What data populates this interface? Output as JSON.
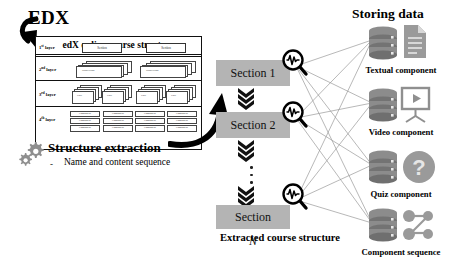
{
  "heading": {
    "brand": "EDX"
  },
  "panel": {
    "title": "edX online course structure",
    "layers": [
      {
        "label_num": "1",
        "label_sup": "st",
        "label_rest": " layer",
        "items": [
          "Section",
          "Section"
        ]
      },
      {
        "label_num": "2",
        "label_sup": "nd",
        "label_rest": " layer",
        "items": [
          "Subsection",
          "Subsection"
        ]
      },
      {
        "label_num": "3",
        "label_sup": "rd",
        "label_rest": " layer",
        "items": [
          "Unit",
          "Unit",
          "Unit",
          "Unit"
        ]
      },
      {
        "label_num": "4",
        "label_sup": "th",
        "label_rest": " layer",
        "items": [
          "Component",
          "Component",
          "Component",
          "Component"
        ]
      }
    ]
  },
  "structure_extraction": {
    "title": "Structure extraction",
    "bullet_dash": "-",
    "bullet_text": "Name and content sequence",
    "icon": "gears-icon"
  },
  "middle": {
    "sections": [
      {
        "name": "section-1",
        "label": "Section 1",
        "italic_suffix": ""
      },
      {
        "name": "section-2",
        "label": "Section 2",
        "italic_suffix": ""
      },
      {
        "name": "section-n",
        "label": "Section ",
        "italic_suffix": "N"
      }
    ],
    "caption": "Extracted course structure",
    "magnifier_icon": "magnifier-waveform-icon",
    "chevron_icon": "triple-chevron-down-icon",
    "ellipsis_icon": "vertical-dots-icon",
    "arrow_icon": "curved-arrow-icon"
  },
  "storing": {
    "title": "Storing data",
    "items": [
      {
        "key": "textual",
        "label": "Textual component",
        "db_icon": "database-icon",
        "type_icon": "document-icon"
      },
      {
        "key": "video",
        "label": "Video component",
        "db_icon": "database-icon",
        "type_icon": "video-projector-icon"
      },
      {
        "key": "quiz",
        "label": "Quiz component",
        "db_icon": "database-icon",
        "type_icon": "question-mark-icon"
      },
      {
        "key": "sequence",
        "label": "Component sequence",
        "db_icon": "database-icon",
        "type_icon": "node-graph-icon"
      }
    ]
  },
  "colors": {
    "section_fill": "#b4b4b4",
    "icon_gray": "#8c8c8c",
    "icon_gray_dark": "#6f6f6f",
    "line": "#9a9a9a",
    "ink": "#111111"
  }
}
